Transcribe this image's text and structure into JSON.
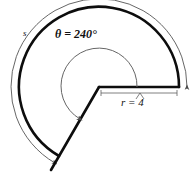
{
  "figure": {
    "type": "circular-sector-diagram",
    "labels": {
      "theta": "θ = 240°",
      "radius": "r = 4",
      "arc": "s"
    },
    "values": {
      "theta_degrees": 240,
      "radius": 4,
      "arc_symbol": "s"
    },
    "colors": {
      "stroke_bold": "#0d0d0d",
      "stroke_thin": "#5a5a5a",
      "background": "#ffffff",
      "text": "#111111"
    },
    "geometry": {
      "center_x": 99,
      "center_y": 87,
      "bold_radius": 80,
      "thin_radius": 88,
      "angle_arc_radius": 38,
      "sector_start_deg": 0,
      "sector_sweep_deg": 240
    }
  }
}
